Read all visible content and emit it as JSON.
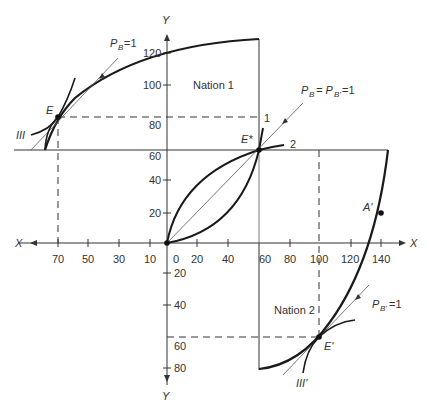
{
  "diagram": {
    "type": "offer-curve / box construction (trade theory)",
    "axes": {
      "x_label_left": "X",
      "x_label_right": "X",
      "y_label_top": "Y",
      "y_label_bottom": "Y",
      "x_ticks_left": [
        "70",
        "50",
        "30",
        "10"
      ],
      "x_ticks_right": [
        "0",
        "20",
        "40",
        "60",
        "80",
        "100",
        "120",
        "140"
      ],
      "y_ticks_up": [
        "120",
        "100",
        "80",
        "60",
        "40",
        "20"
      ],
      "y_ticks_down": [
        "20",
        "40",
        "60",
        "80"
      ]
    },
    "labels": {
      "nation1": "Nation 1",
      "nation2": "Nation 2",
      "point_E": "E",
      "point_E_star": "E*",
      "point_E_prime": "E'",
      "point_A_prime": "A'",
      "indiff_III": "III",
      "indiff_III_prime": "III'",
      "curve_1": "1",
      "curve_2": "2",
      "price_line_B_sub": "B",
      "price_line_B_eq": "=1",
      "price_line_Bp_sub": "B'",
      "price_line_Bp_eq": "=1",
      "price_line_center_a": "P",
      "price_line_center_b": "= P",
      "price_line_center_sub1": "B",
      "price_line_center_sub2": "B'",
      "price_line_center_eq": "=1",
      "price_P": "P"
    },
    "colors": {
      "curve": "#1a1a1a",
      "axis": "#333333",
      "thin": "#555555",
      "text": "#333333"
    }
  }
}
